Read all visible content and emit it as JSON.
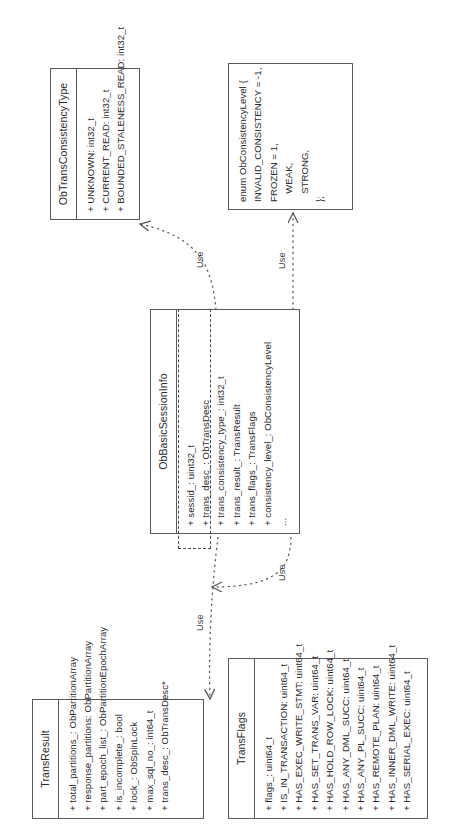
{
  "diagram": {
    "kind": "uml-class-diagram",
    "orientation": "rotated-90-ccw",
    "stroke_color": "#5a5a5a",
    "background_color": "#ffffff",
    "edge_label": "Use"
  },
  "classes": {
    "trans_result": {
      "name": "TransResult",
      "members": [
        "+ total_partitions_: ObPartitionArray",
        "+ response_partitions: ObPartitionArray",
        "+ part_epoch_list_: ObPartitionEpochArray",
        "+ is_incomplete_: bool",
        "+ lock_: ObSpinLock",
        "+ max_sql_no_: int64_t",
        "+ trans_desc_: ObTransDesc*"
      ]
    },
    "trans_flags": {
      "name": "TransFlags",
      "members": [
        "+ flags_: uint64_t",
        "+ IS_IN_TRANSACTION: uint64_t",
        "+ HAS_EXEC_WRITE_STMT: uint64_t",
        "+ HAS_SET_TRANS_VAR: uint64_t",
        "+ HAS_HOLD_ROW_LOCK: uint64_t",
        "+ HAS_ANY_DML_SUCC: uint64_t",
        "+ HAS_ANY_PL_SUCC: uint64_t",
        "+ HAS_REMOTE_PLAN: uint64_t",
        "+ HAS_INNER_DML_WRITE: uint64_t",
        "+ HAS_SERIAL_EXEC: uint64_t"
      ]
    },
    "ob_basic_session_info": {
      "name": "ObBasicSessionInfo",
      "members": [
        "+ sessid_: uint32_t",
        "+ trans_desc_: ObTransDesc",
        "+ trans_consistency_type_: int32_t",
        "+ trans_result_: TransResult",
        "+ trans_flags_: TransFlags",
        "+ consistency_level_: ObConsistencyLevel",
        "..."
      ]
    },
    "ob_trans_consistency_type": {
      "name": "ObTransConsistencyType",
      "members": [
        "+ UNKNOWN: int32_t",
        "+ CURRENT_READ: int32_t",
        "+ BOUNDED_STALENESS_READ: int32_t"
      ]
    }
  },
  "note": {
    "name": "ObConsistencyLevel enum",
    "lines": [
      "enum ObConsistencyLevel {",
      "INVALID_CONSISTENCY = -1,",
      "FROZEN = 1,",
      "   WEAK,",
      "   STRONG,",
      "};"
    ]
  },
  "edges": [
    {
      "id": "e1",
      "from": "ObBasicSessionInfo",
      "to": "TransResult",
      "label": "Use",
      "style": "dashed-dependency"
    },
    {
      "id": "e2",
      "from": "ObBasicSessionInfo",
      "to": "TransFlags",
      "label": "Use",
      "style": "dashed-dependency"
    },
    {
      "id": "e3",
      "from": "ObBasicSessionInfo",
      "to": "ObTransConsistencyType",
      "label": "Use",
      "style": "dashed-dependency"
    },
    {
      "id": "e4",
      "from": "ObBasicSessionInfo",
      "to": "ObConsistencyLevel enum",
      "label": "Use",
      "style": "dashed-dependency"
    }
  ]
}
